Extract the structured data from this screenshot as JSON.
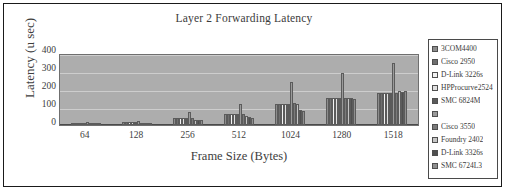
{
  "chart_data": {
    "type": "bar",
    "title": "Layer 2 Forwarding Latency",
    "xlabel": "Frame Size (Bytes)",
    "ylabel": "Latency (u sec)",
    "categories": [
      "64",
      "128",
      "256",
      "512",
      "1024",
      "1280",
      "1518"
    ],
    "yticks": [
      400,
      300,
      200,
      100,
      0
    ],
    "ylim": [
      0,
      400
    ],
    "grid": true,
    "legend_position": "right",
    "series": [
      {
        "name": "3COM4400",
        "color": "#8c8c8c",
        "values": [
          12,
          18,
          40,
          60,
          120,
          155,
          180
        ]
      },
      {
        "name": "Cisco 2950",
        "color": "#6e6e6e",
        "values": [
          12,
          18,
          40,
          60,
          120,
          155,
          180
        ]
      },
      {
        "name": "D-Link 3226s",
        "color": "#f2f2f2",
        "values": [
          12,
          18,
          40,
          60,
          120,
          155,
          180
        ]
      },
      {
        "name": "HPProcurve2524",
        "color": "#e0e0e0",
        "values": [
          12,
          18,
          40,
          60,
          120,
          155,
          180
        ]
      },
      {
        "name": "SMC 6824M",
        "color": "#5a5a5a",
        "values": [
          12,
          18,
          40,
          60,
          120,
          155,
          180
        ]
      },
      {
        "name": "",
        "color": "#9a9a9a",
        "values": [
          18,
          22,
          75,
          120,
          240,
          295,
          348
        ]
      },
      {
        "name": "Cisco 3550",
        "color": "#7a7a7a",
        "values": [
          12,
          14,
          40,
          60,
          125,
          155,
          180
        ]
      },
      {
        "name": "Foundry 2402",
        "color": "#c6c6c6",
        "values": [
          10,
          12,
          30,
          50,
          120,
          150,
          190
        ]
      },
      {
        "name": "D-Link 3326s",
        "color": "#4f4f4f",
        "values": [
          10,
          12,
          28,
          45,
          85,
          150,
          185
        ]
      },
      {
        "name": "SMC 6724L3",
        "color": "#8f8f8f",
        "values": [
          9,
          11,
          26,
          42,
          80,
          148,
          190
        ]
      }
    ]
  }
}
